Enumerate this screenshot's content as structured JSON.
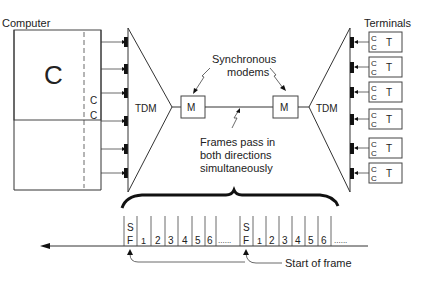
{
  "labels": {
    "computer": "Computer",
    "computer_core": "C",
    "channel_c1": "C",
    "channel_c2": "C",
    "tdm_left": "TDM",
    "tdm_right": "TDM",
    "modem_left": "M",
    "modem_right": "M",
    "sync_modems_line1": "Synchronous",
    "sync_modems_line2": "modems",
    "frames_line1": "Frames pass in",
    "frames_line2": "both directions",
    "frames_line3": "simultaneously",
    "terminals": "Terminals",
    "start_of_frame": "Start of frame"
  },
  "terminals": [
    {
      "cc_top": "C",
      "cc_bottom": "C",
      "label": "T"
    },
    {
      "cc_top": "C",
      "cc_bottom": "C",
      "label": "T"
    },
    {
      "cc_top": "C",
      "cc_bottom": "C",
      "label": "T"
    },
    {
      "cc_top": "C",
      "cc_bottom": "C",
      "label": "T"
    },
    {
      "cc_top": "C",
      "cc_bottom": "C",
      "label": "T"
    },
    {
      "cc_top": "C",
      "cc_bottom": "C",
      "label": "T"
    }
  ],
  "frame": {
    "sf_top": "S",
    "sf_bottom": "F",
    "slots": [
      "1",
      "2",
      "3",
      "4",
      "5",
      "6"
    ],
    "ellipsis": "......"
  }
}
